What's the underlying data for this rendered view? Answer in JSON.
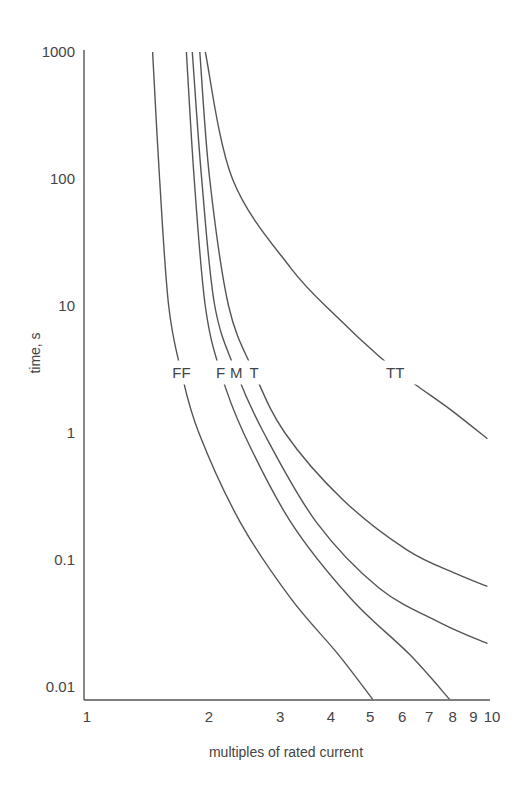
{
  "chart_data": {
    "type": "line",
    "title": "",
    "xlabel": "multiples of rated current",
    "ylabel": "time, s",
    "xscale": "log",
    "yscale": "log",
    "xlim": [
      1,
      10
    ],
    "ylim": [
      0.01,
      1000
    ],
    "grid": false,
    "legend": "inline labels on curves",
    "x_ticks": [
      "1",
      "2",
      "3",
      "4",
      "5",
      "6",
      "7",
      "8",
      "9",
      "10"
    ],
    "y_ticks": [
      "1000",
      "100",
      "10",
      "1",
      "0.1",
      "0.01"
    ],
    "series": [
      {
        "name": "FF",
        "points": [
          [
            1.46,
            1000
          ],
          [
            1.52,
            100
          ],
          [
            1.6,
            10
          ],
          [
            1.72,
            3
          ],
          [
            1.9,
            1
          ],
          [
            2.4,
            0.2
          ],
          [
            3.2,
            0.05
          ],
          [
            4.2,
            0.018
          ],
          [
            5.1,
            0.008
          ]
        ]
      },
      {
        "name": "F",
        "points": [
          [
            1.77,
            1000
          ],
          [
            1.85,
            100
          ],
          [
            1.97,
            10
          ],
          [
            2.15,
            3
          ],
          [
            2.45,
            1
          ],
          [
            3.2,
            0.2
          ],
          [
            4.5,
            0.05
          ],
          [
            6.3,
            0.018
          ],
          [
            7.9,
            0.008
          ]
        ]
      },
      {
        "name": "M",
        "points": [
          [
            1.83,
            1000
          ],
          [
            1.93,
            100
          ],
          [
            2.08,
            10
          ],
          [
            2.35,
            3
          ],
          [
            2.75,
            1
          ],
          [
            3.7,
            0.2
          ],
          [
            5.3,
            0.06
          ],
          [
            7.5,
            0.032
          ],
          [
            9.8,
            0.022
          ]
        ]
      },
      {
        "name": "T",
        "points": [
          [
            1.91,
            1000
          ],
          [
            2.02,
            100
          ],
          [
            2.25,
            10
          ],
          [
            2.6,
            3
          ],
          [
            3.1,
            1
          ],
          [
            4.3,
            0.3
          ],
          [
            6.2,
            0.12
          ],
          [
            8.2,
            0.078
          ],
          [
            9.8,
            0.062
          ]
        ]
      },
      {
        "name": "TT",
        "points": [
          [
            1.97,
            1000
          ],
          [
            2.3,
            100
          ],
          [
            3.2,
            20
          ],
          [
            4.2,
            8
          ],
          [
            5.3,
            4
          ],
          [
            6.4,
            2.5
          ],
          [
            8.0,
            1.5
          ],
          [
            9.8,
            0.9
          ]
        ]
      }
    ],
    "annotations": [
      {
        "text": "FF",
        "x": 1.72,
        "y": 3
      },
      {
        "text": "F",
        "x": 2.15,
        "y": 3
      },
      {
        "text": "M",
        "x": 2.35,
        "y": 3
      },
      {
        "text": "T",
        "x": 2.6,
        "y": 3
      },
      {
        "text": "TT",
        "x": 5.8,
        "y": 3
      }
    ]
  },
  "layout": {
    "plot_left": 86,
    "x_decade_px": 405,
    "plot_top": 52,
    "y_decade_px": 127,
    "x_axis_y": 700,
    "stroke_color": "#555555",
    "text_color": "#444444"
  }
}
